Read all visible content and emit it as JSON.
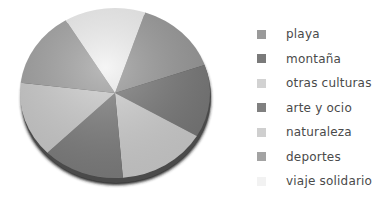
{
  "chart_data": {
    "type": "pie",
    "title": "",
    "style": "3d-shaded-grayscale",
    "start_angle_deg": 18.5,
    "direction": "clockwise",
    "categories": [
      "playa",
      "montaña",
      "otras culturas",
      "arte y ocio",
      "naturaleza",
      "deportes",
      "viaje solidario"
    ],
    "values": [
      14.5,
      13.8,
      15.2,
      13.9,
      14.3,
      14.4,
      13.8
    ],
    "unit": "%",
    "colors": [
      "#9a9a9a",
      "#7a7a7a",
      "#d2d2d2",
      "#808080",
      "#cfcfcf",
      "#a3a3a3",
      "#f2f2f2"
    ],
    "legend_position": "right",
    "legend": [
      {
        "label": "playa",
        "color": "#9a9a9a"
      },
      {
        "label": "montaña",
        "color": "#7a7a7a"
      },
      {
        "label": "otras culturas",
        "color": "#d2d2d2"
      },
      {
        "label": "arte y ocio",
        "color": "#808080"
      },
      {
        "label": "naturaleza",
        "color": "#cfcfcf"
      },
      {
        "label": "deportes",
        "color": "#a3a3a3"
      },
      {
        "label": "viaje solidario",
        "color": "#f2f2f2"
      }
    ]
  }
}
